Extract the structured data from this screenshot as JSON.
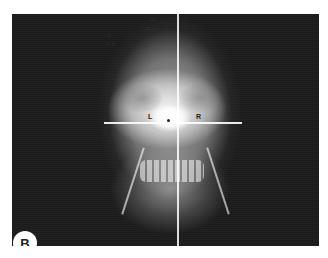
{
  "figure": {
    "panel_label": "B",
    "image_type": "frontal (PA) skull radiograph",
    "markers": {
      "left": "L",
      "right": "R",
      "center": "•"
    },
    "handwritten_annotations": [
      "H.I",
      "→ R.m",
      "fl",
      "fl. d",
      "d"
    ],
    "reference_lines": [
      "vertical midline",
      "horizontal bi-orbital line",
      "left ramus line",
      "right ramus line"
    ],
    "colors": {
      "background": "#ffffff",
      "radiograph_background": "#1c1c1c",
      "panel_label_bg": "#ffffff",
      "panel_label_text": "#222222"
    }
  }
}
